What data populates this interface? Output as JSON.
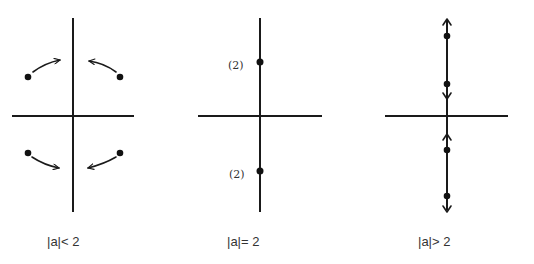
{
  "figure": {
    "panels": [
      {
        "id": "panel-less",
        "caption": "|a|< 2",
        "description": "Four complex roots off the axes, moving toward the imaginary axis",
        "axes": {
          "cx": 73,
          "cy": 116,
          "x1": 12,
          "x2": 134,
          "y1": 18,
          "y2": 212
        },
        "points": [
          {
            "x": 28,
            "y": 77
          },
          {
            "x": 120,
            "y": 77
          },
          {
            "x": 28,
            "y": 153
          },
          {
            "x": 120,
            "y": 153
          }
        ]
      },
      {
        "id": "panel-equal",
        "caption": "|a|= 2",
        "description": "Double roots on the imaginary axis",
        "axes": {
          "cx": 260,
          "cy": 116,
          "x1": 198,
          "x2": 322,
          "y1": 18,
          "y2": 212
        },
        "points": [
          {
            "x": 260,
            "y": 62,
            "multiplicity": "(2)"
          },
          {
            "x": 260,
            "y": 171,
            "multiplicity": "(2)"
          }
        ]
      },
      {
        "id": "panel-greater",
        "caption": "|a|> 2",
        "description": "Four roots on the imaginary axis splitting apart",
        "axes": {
          "cx": 447,
          "cy": 116,
          "x1": 385,
          "x2": 508,
          "y1": 18,
          "y2": 212
        },
        "points": [
          {
            "x": 447,
            "y": 36
          },
          {
            "x": 447,
            "y": 84
          },
          {
            "x": 447,
            "y": 150
          },
          {
            "x": 447,
            "y": 196
          }
        ]
      }
    ],
    "colors": {
      "ink": "#1a1a1a",
      "text": "#333333",
      "background": "#ffffff"
    }
  }
}
